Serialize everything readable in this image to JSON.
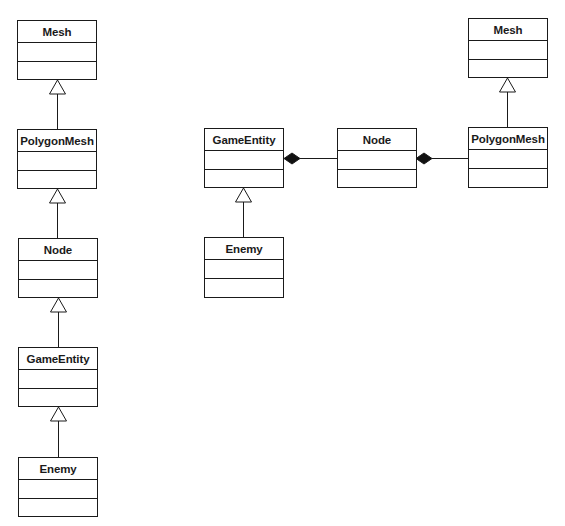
{
  "diagrams": {
    "left_chain": {
      "description": "Inheritance hierarchy",
      "classes": [
        {
          "id": "l-mesh",
          "name": "Mesh"
        },
        {
          "id": "l-polygonmesh",
          "name": "PolygonMesh"
        },
        {
          "id": "l-node",
          "name": "Node"
        },
        {
          "id": "l-gameentity",
          "name": "GameEntity"
        },
        {
          "id": "l-enemy",
          "name": "Enemy"
        }
      ],
      "relations": [
        {
          "type": "generalization",
          "from": "PolygonMesh",
          "to": "Mesh"
        },
        {
          "type": "generalization",
          "from": "Node",
          "to": "PolygonMesh"
        },
        {
          "type": "generalization",
          "from": "GameEntity",
          "to": "Node"
        },
        {
          "type": "generalization",
          "from": "Enemy",
          "to": "GameEntity"
        }
      ]
    },
    "right_composition": {
      "description": "Composition hierarchy",
      "classes": [
        {
          "id": "r-mesh",
          "name": "Mesh"
        },
        {
          "id": "r-gameentity",
          "name": "GameEntity"
        },
        {
          "id": "r-node",
          "name": "Node"
        },
        {
          "id": "r-polygonmesh",
          "name": "PolygonMesh"
        },
        {
          "id": "r-enemy",
          "name": "Enemy"
        }
      ],
      "relations": [
        {
          "type": "composition",
          "whole": "GameEntity",
          "part": "Node"
        },
        {
          "type": "composition",
          "whole": "Node",
          "part": "PolygonMesh"
        },
        {
          "type": "generalization",
          "from": "PolygonMesh",
          "to": "Mesh"
        },
        {
          "type": "generalization",
          "from": "Enemy",
          "to": "GameEntity"
        }
      ]
    }
  },
  "colors": {
    "line": "#1a1a1a",
    "background": "#ffffff"
  }
}
